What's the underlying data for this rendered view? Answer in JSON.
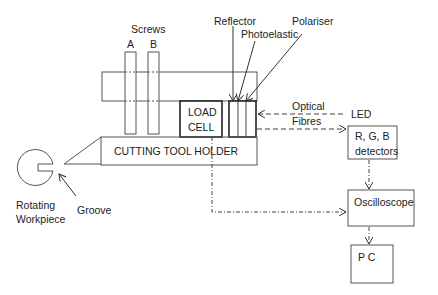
{
  "diagram": {
    "labels": {
      "screws": "Screws",
      "screw_a": "A",
      "screw_b": "B",
      "reflector": "Reflector",
      "photoelastic": "Photoelastic",
      "polariser": "Polariser",
      "optical": "Optical",
      "fibres": "Fibres",
      "led": "LED",
      "load_cell_line1": "LOAD",
      "load_cell_line2": "CELL",
      "cutting_tool_holder": "CUTTING TOOL HOLDER",
      "rotating": "Rotating",
      "workpiece": "Workpiece",
      "groove": "Groove"
    },
    "boxes": {
      "detectors_line1": "R, G, B",
      "detectors_line2": "detectors",
      "oscilloscope": "Oscilloscope",
      "pc": "P C"
    },
    "connections": [
      {
        "from": "LED",
        "to": "Polariser",
        "style": "dashed",
        "label": "Optical Fibres"
      },
      {
        "from": "Polariser",
        "to": "R, G, B detectors",
        "style": "dashed"
      },
      {
        "from": "R, G, B detectors",
        "to": "Oscilloscope",
        "style": "dash-dot"
      },
      {
        "from": "LOAD CELL",
        "to": "Oscilloscope",
        "style": "dash-dot"
      },
      {
        "from": "Oscilloscope",
        "to": "P C",
        "style": "dash-dot"
      }
    ],
    "colors": {
      "line": "#333333",
      "box_border": "#555555",
      "background": "#ffffff"
    }
  }
}
